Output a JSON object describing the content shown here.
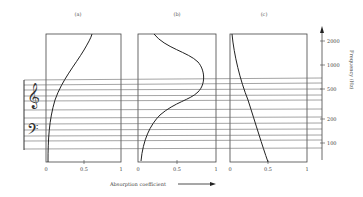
{
  "panels": [
    {
      "label": "(a)",
      "type": "porous-absorber",
      "x_ticks": [
        "0",
        "0.5",
        "1"
      ]
    },
    {
      "label": "(b)",
      "type": "resonant-absorber",
      "x_ticks": [
        "0",
        "0.5",
        "1"
      ]
    },
    {
      "label": "(c)",
      "type": "panel-absorber",
      "x_ticks": [
        "0",
        "0.5",
        "1"
      ]
    }
  ],
  "x_axis_label": "Absorption coefficient",
  "y_axis_label": "Frequency (Hz)",
  "frequency_ticks": [
    "2000",
    "1000",
    "500",
    "200",
    "100"
  ],
  "curves": {
    "a": {
      "description": "absorption rises with frequency",
      "values_at": {
        "100": 0.02,
        "200": 0.1,
        "500": 0.3,
        "1000": 0.45,
        "2000": 0.6
      }
    },
    "b": {
      "description": "peak absorption in mid frequencies",
      "values_at": {
        "100": 0.05,
        "200": 0.2,
        "500": 0.8,
        "1000": 0.7,
        "2000": 0.2
      }
    },
    "c": {
      "description": "absorption falls with frequency",
      "values_at": {
        "100": 0.45,
        "200": 0.35,
        "500": 0.15,
        "1000": 0.05,
        "2000": 0.0
      }
    }
  },
  "colors": {
    "line": "#333333",
    "staff": "#555555",
    "background": "#ffffff"
  }
}
